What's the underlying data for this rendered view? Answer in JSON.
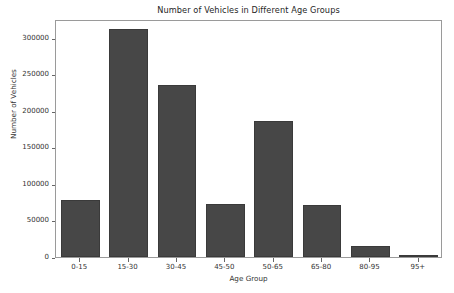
{
  "chart_data": {
    "type": "bar",
    "title": "Number of Vehicles in Different Age Groups",
    "xlabel": "Age Group",
    "ylabel": "Number of Vehicles",
    "categories": [
      "0-15",
      "15-30",
      "30-45",
      "45-50",
      "50-65",
      "65-80",
      "80-95",
      "95+"
    ],
    "values": [
      78000,
      312000,
      235000,
      72500,
      186000,
      71500,
      15000,
      500
    ],
    "ylim": [
      0,
      326000
    ],
    "yticks": [
      0,
      50000,
      100000,
      150000,
      200000,
      250000,
      300000
    ],
    "ytick_labels": [
      "0",
      "50000",
      "100000",
      "150000",
      "200000",
      "250000",
      "300000"
    ],
    "grid": false,
    "legend": null,
    "bar_color": "#474747",
    "bar_edge_color": "#3a3a3a",
    "axes_color": "#9a9a9a",
    "text_color": "#333333",
    "background": "#ffffff",
    "bar_width_fraction": 0.8
  }
}
